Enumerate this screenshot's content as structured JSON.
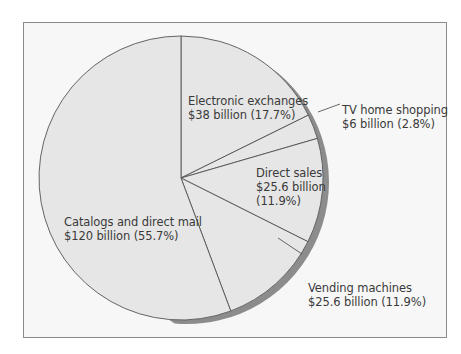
{
  "chart_data": {
    "type": "pie",
    "title": "",
    "start_angle_deg": 0,
    "direction": "clockwise",
    "slices": [
      {
        "label": "Electronic exchanges",
        "value_text": "$38 billion (17.7%)",
        "value": 38,
        "percent": 17.7
      },
      {
        "label": "TV home shopping",
        "value_text": "$6 billion (2.8%)",
        "value": 6,
        "percent": 2.8
      },
      {
        "label": "Direct sales",
        "value_text": "$25.6 billion (11.9%)",
        "value": 25.6,
        "percent": 11.9
      },
      {
        "label": "Vending machines",
        "value_text": "$25.6 billion (11.9%)",
        "value": 25.6,
        "percent": 11.9
      },
      {
        "label": "Catalogs and direct mail",
        "value_text": "$120 billion (55.7%)",
        "value": 120,
        "percent": 55.7
      }
    ],
    "colors": {
      "slice_fill": "#e6e6e6",
      "edge": "#555555",
      "shadow": "#8c8c8c",
      "background": "#f7f7f7"
    }
  },
  "labels": {
    "electronic": {
      "line1": "Electronic exchanges",
      "line2": "$38 billion (17.7%)"
    },
    "tv": {
      "line1": "TV home shopping",
      "line2": "$6 billion (2.8%)"
    },
    "direct": {
      "line1": "Direct sales",
      "line2": "$25.6 billion",
      "line3": "(11.9%)"
    },
    "vending": {
      "line1": "Vending machines",
      "line2": "$25.6 billion (11.9%)"
    },
    "catalogs": {
      "line1": "Catalogs and direct mail",
      "line2": "$120 billion (55.7%)"
    }
  }
}
